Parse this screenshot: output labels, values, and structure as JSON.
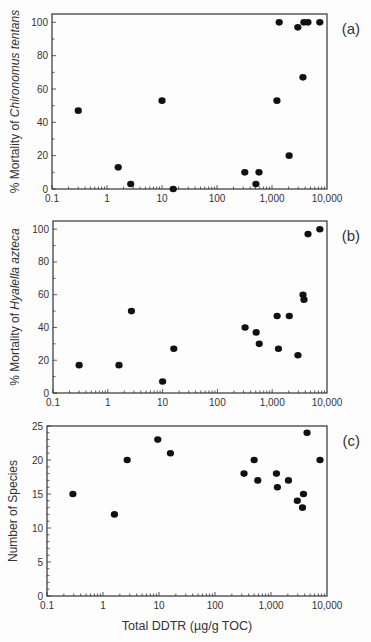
{
  "figure": {
    "xlabel": "Total DDTR (µg/g TOC)",
    "x_ticks": [
      0.1,
      1,
      10,
      100,
      1000,
      10000
    ],
    "x_tick_labels": [
      "0.1",
      "1",
      "10",
      "100",
      "1,000",
      "10,000"
    ],
    "x_scale": "log"
  },
  "chart_data": [
    {
      "type": "scatter",
      "panel": "(a)",
      "title": "",
      "xlabel": "",
      "ylabel_prefix": "% Mortality of ",
      "ylabel_species": "Chironomus tentans",
      "xlim": [
        0.1,
        10000
      ],
      "ylim": [
        0,
        105
      ],
      "y_ticks": [
        0,
        20,
        40,
        60,
        80,
        100
      ],
      "y_minor_step": 10,
      "points": [
        {
          "x": 0.3,
          "y": 47
        },
        {
          "x": 1.6,
          "y": 13
        },
        {
          "x": 2.7,
          "y": 3
        },
        {
          "x": 10,
          "y": 53
        },
        {
          "x": 16,
          "y": 0
        },
        {
          "x": 320,
          "y": 10
        },
        {
          "x": 510,
          "y": 3
        },
        {
          "x": 580,
          "y": 10
        },
        {
          "x": 1230,
          "y": 53
        },
        {
          "x": 1350,
          "y": 100
        },
        {
          "x": 2050,
          "y": 20
        },
        {
          "x": 2950,
          "y": 97
        },
        {
          "x": 3650,
          "y": 67
        },
        {
          "x": 3800,
          "y": 100
        },
        {
          "x": 4500,
          "y": 100
        },
        {
          "x": 7400,
          "y": 100
        }
      ]
    },
    {
      "type": "scatter",
      "panel": "(b)",
      "title": "",
      "xlabel": "",
      "ylabel_prefix": "% Mortality of ",
      "ylabel_species": "Hyalella azteca",
      "xlim": [
        0.1,
        10000
      ],
      "ylim": [
        0,
        105
      ],
      "y_ticks": [
        0,
        20,
        40,
        60,
        80,
        100
      ],
      "y_minor_step": 10,
      "points": [
        {
          "x": 0.3,
          "y": 17
        },
        {
          "x": 1.6,
          "y": 17
        },
        {
          "x": 2.7,
          "y": 50
        },
        {
          "x": 10,
          "y": 7
        },
        {
          "x": 16,
          "y": 27
        },
        {
          "x": 320,
          "y": 40
        },
        {
          "x": 510,
          "y": 37
        },
        {
          "x": 580,
          "y": 30
        },
        {
          "x": 1230,
          "y": 47
        },
        {
          "x": 1300,
          "y": 27
        },
        {
          "x": 2050,
          "y": 47
        },
        {
          "x": 2950,
          "y": 23
        },
        {
          "x": 3650,
          "y": 60
        },
        {
          "x": 3800,
          "y": 57
        },
        {
          "x": 4500,
          "y": 97
        },
        {
          "x": 7400,
          "y": 100
        }
      ]
    },
    {
      "type": "scatter",
      "panel": "(c)",
      "title": "",
      "xlabel": "Total DDTR (µg/g TOC)",
      "ylabel_prefix": "Number of Species",
      "ylabel_species": "",
      "xlim": [
        0.1,
        10000
      ],
      "ylim": [
        0,
        25
      ],
      "y_ticks": [
        0,
        5,
        10,
        15,
        20,
        25
      ],
      "y_minor_step": 1,
      "points": [
        {
          "x": 0.29,
          "y": 15
        },
        {
          "x": 1.6,
          "y": 12
        },
        {
          "x": 2.7,
          "y": 20
        },
        {
          "x": 9.5,
          "y": 23
        },
        {
          "x": 16,
          "y": 21
        },
        {
          "x": 330,
          "y": 18
        },
        {
          "x": 500,
          "y": 20
        },
        {
          "x": 580,
          "y": 17
        },
        {
          "x": 1250,
          "y": 18
        },
        {
          "x": 1300,
          "y": 16
        },
        {
          "x": 2050,
          "y": 17
        },
        {
          "x": 2950,
          "y": 14
        },
        {
          "x": 3650,
          "y": 13
        },
        {
          "x": 3800,
          "y": 15
        },
        {
          "x": 4400,
          "y": 24
        },
        {
          "x": 7500,
          "y": 20
        }
      ]
    }
  ],
  "layout": {
    "panels": [
      {
        "left": 52,
        "right": 327,
        "top": 14,
        "bottom": 189
      },
      {
        "left": 53,
        "right": 327,
        "top": 221,
        "bottom": 393
      },
      {
        "left": 47,
        "right": 327,
        "top": 426,
        "bottom": 596
      }
    ]
  }
}
